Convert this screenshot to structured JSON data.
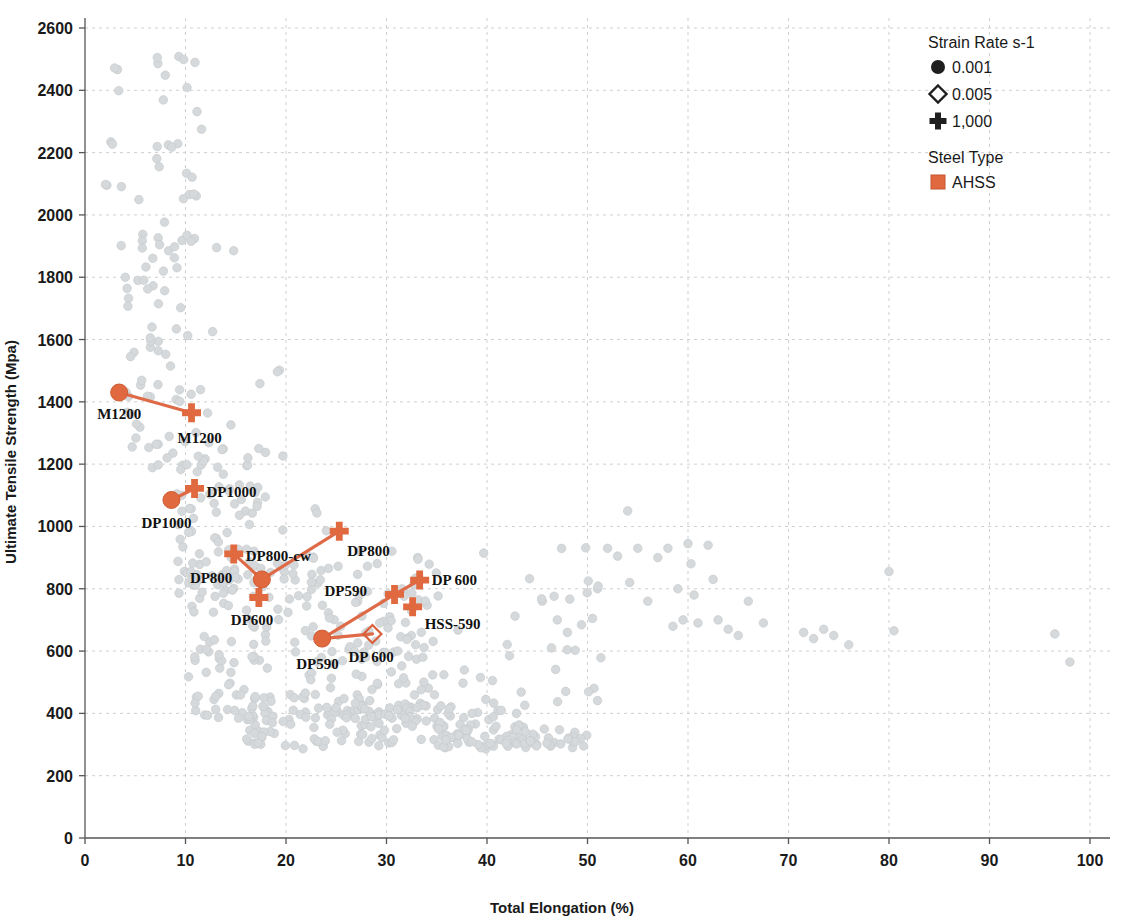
{
  "chart_data": {
    "type": "scatter",
    "title": "",
    "xlabel": "Total Elongation (%)",
    "ylabel": "Ultimate Tensile Strength (Mpa)",
    "xlim": [
      0,
      100
    ],
    "ylim": [
      0,
      2600
    ],
    "xticks": [
      0,
      10,
      20,
      30,
      40,
      50,
      60,
      70,
      80,
      90,
      100
    ],
    "yticks": [
      0,
      200,
      400,
      600,
      800,
      1000,
      1200,
      1400,
      1600,
      1800,
      2000,
      2200,
      2400,
      2600
    ],
    "grid": true,
    "legend_position": "top-right",
    "legends": [
      {
        "title": "Strain Rate s-1",
        "entries": [
          {
            "marker": "circle",
            "label": "0.001"
          },
          {
            "marker": "diamond",
            "label": "0.005"
          },
          {
            "marker": "plus",
            "label": "1,000"
          }
        ]
      },
      {
        "title": "Steel Type",
        "entries": [
          {
            "marker": "square",
            "label": "AHSS",
            "color": "#e0693f"
          }
        ]
      }
    ],
    "colors": {
      "highlight": "#e0693f",
      "highlight_line": "#df6a48",
      "background_points": "#d6d9db"
    },
    "highlight_series": [
      {
        "group": "M1200",
        "points": [
          {
            "label": "M1200",
            "marker": "circle",
            "x": 3.4,
            "y": 1430,
            "label_dx": -22,
            "label_dy": 26
          },
          {
            "label": "M1200",
            "marker": "plus",
            "x": 10.6,
            "y": 1365,
            "label_dx": -14,
            "label_dy": 30
          }
        ],
        "links": [
          [
            0,
            1
          ]
        ]
      },
      {
        "group": "DP1000",
        "points": [
          {
            "label": "DP1000",
            "marker": "circle",
            "x": 8.6,
            "y": 1085,
            "label_dx": -30,
            "label_dy": 28
          },
          {
            "label": "DP1000",
            "marker": "plus",
            "x": 10.9,
            "y": 1122,
            "label_dx": 12,
            "label_dy": 9
          }
        ],
        "links": [
          [
            0,
            1
          ]
        ]
      },
      {
        "group": "DP800",
        "points": [
          {
            "label": "DP800",
            "marker": "circle",
            "x": 17.6,
            "y": 830,
            "label_dx": -72,
            "label_dy": 4
          },
          {
            "label": "DP800-cw",
            "marker": "plus",
            "x": 14.8,
            "y": 912,
            "label_dx": 12,
            "label_dy": 7
          },
          {
            "label": "DP800",
            "marker": "plus",
            "x": 25.3,
            "y": 985,
            "label_dx": 8,
            "label_dy": 25
          },
          {
            "label": "DP600",
            "marker": "plus",
            "x": 17.3,
            "y": 772,
            "label_dx": -28,
            "label_dy": 28
          }
        ],
        "links": [
          [
            0,
            1
          ],
          [
            0,
            2
          ],
          [
            0,
            3
          ]
        ]
      },
      {
        "group": "DP590",
        "points": [
          {
            "label": "DP590",
            "marker": "circle",
            "x": 23.6,
            "y": 640,
            "label_dx": -26,
            "label_dy": 30
          },
          {
            "label": "DP590",
            "marker": "plus",
            "x": 30.8,
            "y": 782,
            "label_dx": -70,
            "label_dy": 2
          },
          {
            "label": "DP 600",
            "marker": "plus",
            "x": 33.3,
            "y": 828,
            "label_dx": 12,
            "label_dy": 5
          },
          {
            "label": "DP 600",
            "marker": "diamond",
            "x": 28.6,
            "y": 655,
            "label_dx": -24,
            "label_dy": 28
          },
          {
            "label": "HSS-590",
            "marker": "plus",
            "x": 32.6,
            "y": 742,
            "label_dx": 12,
            "label_dy": 22
          }
        ],
        "links": [
          [
            0,
            1
          ],
          [
            0,
            3
          ],
          [
            1,
            2
          ]
        ]
      }
    ],
    "background_cloud_note": "Large light-gray scatter cloud of ~600 steel grades: high-strength low-elongation tail at upper left (1800-2500 MPa below 10%), broad dense band 300-900 MPa between 10-35% elongation, and a sparse tapering tail of 300-900 MPa points extending to 98% elongation."
  }
}
